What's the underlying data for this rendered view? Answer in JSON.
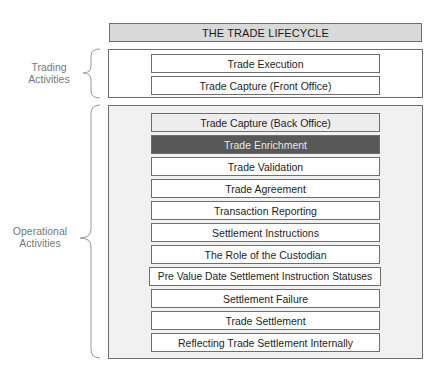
{
  "diagram": {
    "title": "THE TRADE LIFECYCLE",
    "groups": [
      {
        "label_lines": [
          "Trading",
          "Activities"
        ],
        "steps": [
          {
            "label": "Trade Execution",
            "style": "normal"
          },
          {
            "label": "Trade Capture (Front Office)",
            "style": "normal"
          }
        ]
      },
      {
        "label_lines": [
          "Operational",
          "Activities"
        ],
        "steps": [
          {
            "label": "Trade Capture (Back Office)",
            "style": "shaded"
          },
          {
            "label": "Trade Enrichment",
            "style": "highlight"
          },
          {
            "label": "Trade Validation",
            "style": "normal"
          },
          {
            "label": "Trade Agreement",
            "style": "normal"
          },
          {
            "label": "Transaction Reporting",
            "style": "normal"
          },
          {
            "label": "Settlement Instructions",
            "style": "normal"
          },
          {
            "label": "The Role of the Custodian",
            "style": "normal"
          },
          {
            "label": "Pre Value Date Settlement Instruction Statuses",
            "style": "wide"
          },
          {
            "label": "Settlement Failure",
            "style": "normal"
          },
          {
            "label": "Trade Settlement",
            "style": "normal"
          },
          {
            "label": "Reflecting Trade Settlement Internally",
            "style": "normal"
          }
        ]
      }
    ],
    "colors": {
      "title_fill": "#d9d9d9",
      "ops_fill": "#f1f1f1",
      "highlight_fill": "#585858",
      "shaded_fill": "#ededed",
      "border": "#6e6e6e",
      "label_text": "#777777"
    }
  }
}
